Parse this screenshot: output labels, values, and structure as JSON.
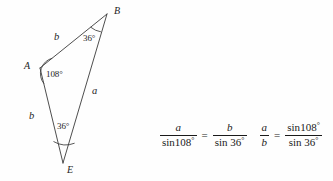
{
  "figure": {
    "stroke_color": "#3a3a3a",
    "background_color": "#fefefe",
    "vertices": [
      {
        "name": "B",
        "label": "B",
        "x": 107,
        "y": 14,
        "label_x": 114,
        "label_y": 8
      },
      {
        "name": "A",
        "label": "A",
        "x": 40,
        "y": 68,
        "label_x": 25,
        "label_y": 63
      },
      {
        "name": "E",
        "label": "E",
        "x": 63,
        "y": 163,
        "label_x": 67,
        "label_y": 166
      }
    ],
    "sides": [
      {
        "name": "side-AB",
        "label": "b",
        "label_x": 54,
        "label_y": 33
      },
      {
        "name": "side-AE",
        "label": "b",
        "label_x": 30,
        "label_y": 112
      },
      {
        "name": "side-BE",
        "label": "a",
        "label_x": 92,
        "label_y": 87
      }
    ],
    "angles": [
      {
        "name": "angle-B",
        "label": "36°",
        "label_x": 84,
        "label_y": 35
      },
      {
        "name": "angle-A",
        "label": "108°",
        "label_x": 46,
        "label_y": 70
      },
      {
        "name": "angle-E",
        "label": "36°",
        "label_x": 57,
        "label_y": 123
      }
    ]
  },
  "equations": {
    "first": {
      "left_numerator": "a",
      "left_denominator_fn": "sin",
      "left_denominator_angle": "108",
      "relation": "=",
      "right_numerator": "b",
      "right_denominator_fn": "sin ",
      "right_denominator_angle": "36"
    },
    "second": {
      "left_numerator": "a",
      "left_denominator": "b",
      "relation": "=",
      "right_numerator_fn": "sin",
      "right_numerator_angle": "108",
      "right_denominator_fn": "sin ",
      "right_denominator_angle": "36"
    },
    "degree_symbol": "°"
  }
}
